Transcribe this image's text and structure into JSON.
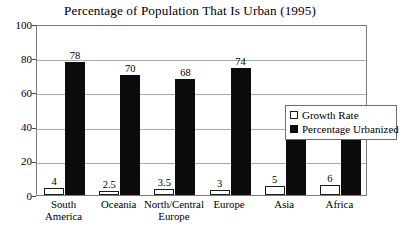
{
  "chart_data": {
    "type": "bar",
    "title": "Percentage of Population That Is Urban (1995)",
    "xlabel": "",
    "ylabel": "",
    "ylim": [
      0,
      100
    ],
    "yticks": [
      0,
      20,
      40,
      60,
      80,
      100
    ],
    "ytick_labels": [
      "0",
      "20",
      "40",
      "60",
      "80",
      "100"
    ],
    "grid": true,
    "legend_position": "inside-right",
    "categories": [
      "South\nAmerica",
      "Oceania",
      "North/Central\nEurope",
      "Europe",
      "Asia",
      "Africa"
    ],
    "category_lines": [
      [
        "South",
        "America"
      ],
      [
        "Oceania"
      ],
      [
        "North/Central",
        "Europe"
      ],
      [
        "Europe"
      ],
      [
        "Asia"
      ],
      [
        "Africa"
      ]
    ],
    "series": [
      {
        "name": "Growth Rate",
        "color": "#ffffff",
        "edge_color": "#1a1a1a",
        "values": [
          4,
          2.5,
          3.5,
          3,
          5,
          6
        ],
        "value_labels": [
          "4",
          "2.5",
          "3.5",
          "3",
          "5",
          "6"
        ]
      },
      {
        "name": "Percentage Urbanized",
        "color": "#0b0b0b",
        "edge_color": "#0b0b0b",
        "values": [
          78,
          70,
          68,
          74,
          35,
          34
        ],
        "value_labels": [
          "78",
          "70",
          "68",
          "74",
          "35",
          "34"
        ]
      }
    ]
  },
  "legend": {
    "items": [
      {
        "label": "Growth Rate",
        "swatch": "open-square-swatch"
      },
      {
        "label": "Percentage Urbanized",
        "swatch": "filled-square-swatch"
      }
    ]
  },
  "colors": {
    "background": "#ffffff",
    "axis": "#7a7a7a",
    "gridline": "#aaaaaa",
    "text": "#000000",
    "bar_growth": "#ffffff",
    "bar_urban": "#0b0b0b"
  }
}
